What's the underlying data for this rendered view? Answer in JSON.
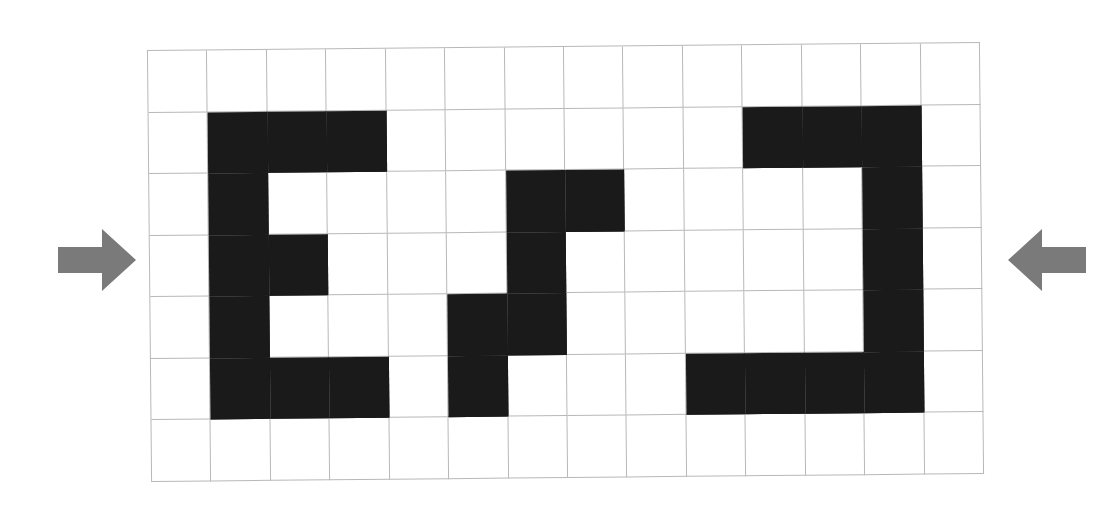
{
  "scene": {
    "background_color": "#ffffff",
    "description": "Grid puzzle board with three black block shapes and two gray arrows pointing inward"
  },
  "board": {
    "columns": 14,
    "rows": 7,
    "grid_line_color": "#b8b8b8",
    "cell_fill_color": "#1a1a1a",
    "cell_empty_color": "#ffffff",
    "rotation_deg": -0.55,
    "filled_cells": [
      [
        1,
        1
      ],
      [
        2,
        1
      ],
      [
        3,
        1
      ],
      [
        10,
        1
      ],
      [
        11,
        1
      ],
      [
        12,
        1
      ],
      [
        1,
        2
      ],
      [
        6,
        2
      ],
      [
        7,
        2
      ],
      [
        12,
        2
      ],
      [
        1,
        3
      ],
      [
        2,
        3
      ],
      [
        6,
        3
      ],
      [
        12,
        3
      ],
      [
        1,
        4
      ],
      [
        5,
        4
      ],
      [
        6,
        4
      ],
      [
        12,
        4
      ],
      [
        1,
        5
      ],
      [
        2,
        5
      ],
      [
        3,
        5
      ],
      [
        5,
        5
      ],
      [
        9,
        5
      ],
      [
        10,
        5
      ],
      [
        11,
        5
      ],
      [
        12,
        5
      ]
    ],
    "shapes": [
      {
        "name": "letter-e-shape",
        "cells": [
          [
            1,
            1
          ],
          [
            2,
            1
          ],
          [
            3,
            1
          ],
          [
            1,
            2
          ],
          [
            1,
            3
          ],
          [
            2,
            3
          ],
          [
            1,
            4
          ],
          [
            1,
            5
          ],
          [
            2,
            5
          ],
          [
            3,
            5
          ]
        ]
      },
      {
        "name": "zigzag-s-shape",
        "cells": [
          [
            6,
            2
          ],
          [
            7,
            2
          ],
          [
            6,
            3
          ],
          [
            5,
            4
          ],
          [
            6,
            4
          ],
          [
            5,
            5
          ]
        ]
      },
      {
        "name": "reversed-c-shape",
        "cells": [
          [
            10,
            1
          ],
          [
            11,
            1
          ],
          [
            12,
            1
          ],
          [
            12,
            2
          ],
          [
            12,
            3
          ],
          [
            12,
            4
          ],
          [
            9,
            5
          ],
          [
            10,
            5
          ],
          [
            11,
            5
          ],
          [
            12,
            5
          ]
        ]
      }
    ]
  },
  "arrows": {
    "color": "#7a7a7a",
    "left": {
      "label": "arrow-pointing-right",
      "direction": "right"
    },
    "right": {
      "label": "arrow-pointing-left",
      "direction": "left"
    }
  }
}
